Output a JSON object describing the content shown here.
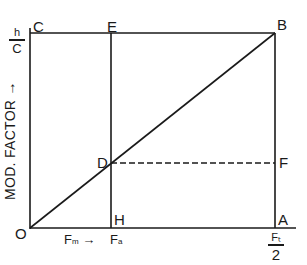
{
  "diagram": {
    "points": {
      "O": "O",
      "C": "C",
      "E": "E",
      "B": "B",
      "D": "D",
      "F": "F",
      "H": "H",
      "A": "A"
    },
    "y_axis": {
      "label": "MOD. FACTOR",
      "arrow": "→",
      "top_tick": {
        "numerator": "h",
        "denominator": "C"
      }
    },
    "x_axis": {
      "label_fm": "F",
      "label_fm_sub": "m",
      "arrow": "→",
      "label_fa": "F",
      "label_fa_sub": "a",
      "end_tick": {
        "numerator": "Fₜ",
        "denominator": "2"
      }
    },
    "colors": {
      "line": "#1a1a1a",
      "background": "#ffffff"
    }
  }
}
